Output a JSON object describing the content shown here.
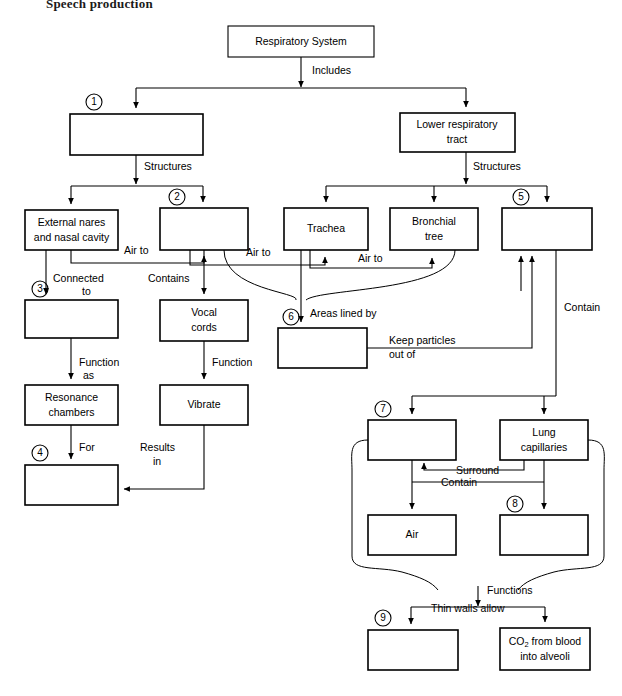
{
  "page": {
    "heading": "Speech production"
  },
  "diagram": {
    "type": "concept-map-flowchart",
    "nodes": [
      {
        "id": "respiratory_system",
        "label": "Respiratory System",
        "blank": false,
        "number": null,
        "x": 228,
        "y": 26,
        "w": 146,
        "h": 31
      },
      {
        "id": "upper_tract",
        "label": "",
        "blank": true,
        "number": "1",
        "x": 70,
        "y": 114,
        "w": 133,
        "h": 41
      },
      {
        "id": "lower_tract",
        "label": "Lower respiratory tract",
        "blank": false,
        "number": null,
        "x": 400,
        "y": 113,
        "w": 115,
        "h": 39
      },
      {
        "id": "external_nares",
        "label": "External nares and nasal cavity",
        "blank": false,
        "number": null,
        "x": 25,
        "y": 210,
        "w": 93,
        "h": 40
      },
      {
        "id": "box2",
        "label": "",
        "blank": true,
        "number": "2",
        "x": 160,
        "y": 208,
        "w": 88,
        "h": 42
      },
      {
        "id": "trachea",
        "label": "Trachea",
        "blank": false,
        "number": null,
        "x": 284,
        "y": 208,
        "w": 84,
        "h": 42
      },
      {
        "id": "bronchial_tree",
        "label": "Bronchial tree",
        "blank": false,
        "number": null,
        "x": 390,
        "y": 208,
        "w": 88,
        "h": 42
      },
      {
        "id": "box5",
        "label": "",
        "blank": true,
        "number": "5",
        "x": 502,
        "y": 208,
        "w": 90,
        "h": 42
      },
      {
        "id": "box3",
        "label": "",
        "blank": true,
        "number": "3",
        "x": 25,
        "y": 300,
        "w": 93,
        "h": 38
      },
      {
        "id": "vocal_cords",
        "label": "Vocal cords",
        "blank": false,
        "number": null,
        "x": 160,
        "y": 300,
        "w": 88,
        "h": 41
      },
      {
        "id": "box6",
        "label": "",
        "blank": true,
        "number": "6",
        "x": 278,
        "y": 328,
        "w": 89,
        "h": 40
      },
      {
        "id": "resonance_chambers",
        "label": "Resonance chambers",
        "blank": false,
        "number": null,
        "x": 25,
        "y": 385,
        "w": 93,
        "h": 40
      },
      {
        "id": "vibrate",
        "label": "Vibrate",
        "blank": false,
        "number": null,
        "x": 160,
        "y": 385,
        "w": 88,
        "h": 40
      },
      {
        "id": "box7",
        "label": "",
        "blank": true,
        "number": "7",
        "x": 368,
        "y": 420,
        "w": 88,
        "h": 40
      },
      {
        "id": "lung_capillaries",
        "label": "Lung capillaries",
        "blank": false,
        "number": null,
        "x": 500,
        "y": 420,
        "w": 88,
        "h": 40
      },
      {
        "id": "box4",
        "label": "",
        "blank": true,
        "number": "4",
        "x": 25,
        "y": 465,
        "w": 93,
        "h": 40
      },
      {
        "id": "air",
        "label": "Air",
        "blank": false,
        "number": null,
        "x": 368,
        "y": 515,
        "w": 88,
        "h": 40
      },
      {
        "id": "box8",
        "label": "",
        "blank": true,
        "number": "8",
        "x": 500,
        "y": 515,
        "w": 88,
        "h": 40
      },
      {
        "id": "box9",
        "label": "",
        "blank": true,
        "number": "9",
        "x": 368,
        "y": 630,
        "w": 90,
        "h": 40
      },
      {
        "id": "co2",
        "label": "CO2 from blood into alveoli",
        "label_line1_pre": "CO",
        "label_line1_sub": "2",
        "label_line1_post": " from blood",
        "label_line2": "into alveoli",
        "blank": false,
        "number": null,
        "x": 500,
        "y": 628,
        "w": 90,
        "h": 42
      }
    ],
    "edge_labels": [
      {
        "id": "includes",
        "text": "Includes",
        "x": 312,
        "y": 70
      },
      {
        "id": "structures_left",
        "text": "Structures",
        "x": 139,
        "y": 166
      },
      {
        "id": "structures_right",
        "text": "Structures",
        "x": 465,
        "y": 166
      },
      {
        "id": "air_to_1",
        "text": "Air to",
        "x": 138,
        "y": 250
      },
      {
        "id": "air_to_2",
        "text": "Air to",
        "x": 258,
        "y": 253
      },
      {
        "id": "air_to_3",
        "text": "Air to",
        "x": 375,
        "y": 261
      },
      {
        "id": "connected_to",
        "text": "Connected to",
        "x": 78,
        "y": 278
      },
      {
        "id": "contains",
        "text": "Contains",
        "x": 178,
        "y": 278
      },
      {
        "id": "areas_lined_by",
        "text": "Areas lined by",
        "x": 325,
        "y": 313
      },
      {
        "id": "contain_right",
        "text": "Contain",
        "x": 577,
        "y": 307
      },
      {
        "id": "keep_particles_out_of",
        "text": "Keep particles out of",
        "x": 434,
        "y": 345
      },
      {
        "id": "function_as",
        "text": "Function as",
        "x": 85,
        "y": 362
      },
      {
        "id": "function_vocal",
        "text": "Function",
        "x": 196,
        "y": 362
      },
      {
        "id": "for",
        "text": "For",
        "x": 83,
        "y": 447
      },
      {
        "id": "results_in",
        "text": "Results in",
        "x": 152,
        "y": 450
      },
      {
        "id": "surround",
        "text": "Surround",
        "x": 484,
        "y": 470
      },
      {
        "id": "contain_mid",
        "text": "Contain",
        "x": 466,
        "y": 487
      },
      {
        "id": "functions",
        "text": "Functions",
        "x": 495,
        "y": 590
      },
      {
        "id": "thin_walls_allow",
        "text": "Thin walls allow",
        "x": 472,
        "y": 611
      }
    ]
  }
}
